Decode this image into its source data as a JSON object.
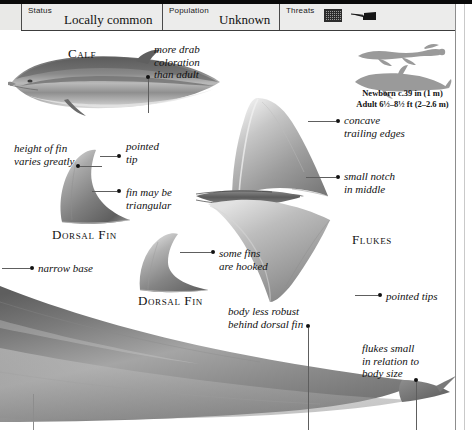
{
  "header": {
    "cells": [
      {
        "label": "Status",
        "value": "Locally common"
      },
      {
        "label": "Population",
        "value": "Unknown"
      },
      {
        "label": "Threats",
        "value": ""
      }
    ],
    "threat_icons": [
      "fishing-net-icon",
      "harpoon-boat-icon"
    ]
  },
  "size_comparison": {
    "newborn_text": "Newborn c.39 in (1 m)",
    "adult_text": "Adult 6½–8½ ft (2–2.6 m)",
    "silhouettes": [
      "human-swimmer-silhouette",
      "dolphin-silhouette"
    ]
  },
  "figures": {
    "calf_label": "Calf",
    "dorsal_fin_label_1": "Dorsal Fin",
    "dorsal_fin_label_2": "Dorsal Fin",
    "flukes_label": "Flukes"
  },
  "annotations": {
    "drab_coloration": "more drab\ncoloration\nthan adult",
    "height_varies": "height of fin\nvaries greatly",
    "pointed_tip": "pointed\ntip",
    "may_be_triangular": "fin may be\ntriangular",
    "concave_edges": "concave\ntrailing edges",
    "small_notch": "small notch\nin middle",
    "some_hooked": "some fins\nare hooked",
    "narrow_base": "narrow base",
    "pointed_tips": "pointed tips",
    "body_less_robust": "body less robust\nbehind dorsal fin",
    "flukes_small": "flukes small\nin relation to\nbody size"
  },
  "colors": {
    "ink": "#111111",
    "rule": "#5e5e5e",
    "header_bg": "#ececeb",
    "art_dark": "#6f6f6f",
    "art_mid": "#9c9c9c",
    "art_light": "#cfcfcf"
  }
}
